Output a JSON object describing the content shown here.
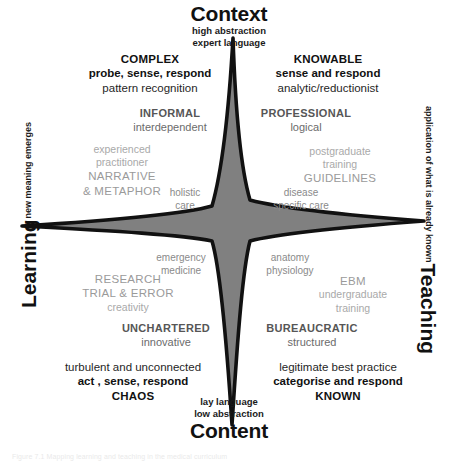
{
  "axes": {
    "top": {
      "title": "Context",
      "sub1": "high abstraction",
      "sub2": "expert language"
    },
    "bottom": {
      "title": "Content",
      "sub1": "lay language",
      "sub2": "low abstraction"
    },
    "left": {
      "title": "Learning",
      "sub": "new meaning emerges"
    },
    "right": {
      "title": "Teaching",
      "sub": "application of what is already known"
    }
  },
  "quadrants": {
    "top_left": {
      "name": "COMPLEX",
      "action": "probe, sense, respond",
      "descriptor": "pattern recognition"
    },
    "top_right": {
      "name": "KNOWABLE",
      "action": "sense and respond",
      "descriptor": "analytic/reductionist"
    },
    "bottom_left": {
      "name": "CHAOS",
      "action": "act , sense, respond",
      "descriptor": "turbulent and unconnected"
    },
    "bottom_right": {
      "name": "KNOWN",
      "action": "categorise and respond",
      "descriptor": "legitimate best practice"
    }
  },
  "mid_labels": {
    "top_left": {
      "name": "INFORMAL",
      "descriptor": "interdependent"
    },
    "top_right": {
      "name": "PROFESSIONAL",
      "descriptor": "logical"
    },
    "bottom_left": {
      "name": "UNCHARTERED",
      "descriptor": "innovative"
    },
    "bottom_right": {
      "name": "BUREAUCRATIC",
      "descriptor": "structured"
    }
  },
  "light_labels": {
    "upper_left": {
      "line1": "experienced",
      "line2": "practitioner",
      "line3": "NARRATIVE",
      "line4": "& METAPHOR"
    },
    "upper_right": {
      "line1": "postgraduate",
      "line2": "training",
      "line3": "GUIDELINES"
    },
    "lower_left": {
      "line1": "RESEARCH",
      "line2": "TRIAL & ERROR",
      "line3": "creativity"
    },
    "lower_right": {
      "line1": "EBM",
      "line2": "undergraduate",
      "line3": "training"
    }
  },
  "inner_labels": {
    "upper_left": {
      "line1": "holistic",
      "line2": "care"
    },
    "upper_right": {
      "line1": "disease",
      "line2": "specific care"
    },
    "lower_left": {
      "line1": "emergency",
      "line2": "medicine"
    },
    "lower_right": {
      "line1": "anatomy",
      "line2": "physiology"
    }
  },
  "colors": {
    "star_fill": "#808080",
    "star_stroke": "#111111",
    "text_dark": "#111111",
    "text_mid": "#6b6b6b",
    "text_light": "#a9a9a9"
  },
  "caption": {
    "line1": "Figure 7.1    Mapping learning and teaching in the medical curriculum"
  }
}
